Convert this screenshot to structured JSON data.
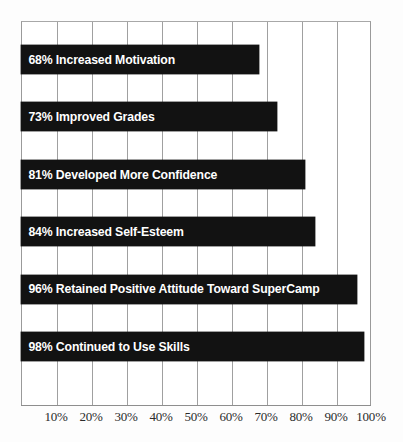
{
  "chart_data": {
    "type": "bar",
    "orientation": "horizontal",
    "title": "",
    "subtitle": "",
    "xlabel": "",
    "ylabel": "",
    "xlim": [
      0,
      100
    ],
    "grid": true,
    "legend": null,
    "categories": [
      "Increased Motivation",
      "Improved Grades",
      "Developed More Confidence",
      "Increased Self-Esteem",
      "Retained Positive Attitude Toward SuperCamp",
      "Continued to Use Skills"
    ],
    "values": [
      68,
      73,
      81,
      84,
      96,
      98
    ],
    "bar_labels": [
      "68% Increased Motivation",
      "73% Improved Grades",
      "81% Developed More Confidence",
      "84% Increased Self-Esteem",
      "96% Retained Positive Attitude Toward SuperCamp",
      "98% Continued to Use Skills"
    ],
    "xticks": [
      10,
      20,
      30,
      40,
      50,
      60,
      70,
      80,
      90,
      100
    ],
    "xtick_labels": [
      "10%",
      "20%",
      "30%",
      "40%",
      "50%",
      "60%",
      "70%",
      "80%",
      "90%",
      "100%"
    ],
    "colors": {
      "bar_fill": "#121212",
      "bar_label_text": "#ffffff",
      "gridline": "#a0a0a0",
      "frame": "#9a9a9a",
      "axis_text": "#2b2b2b",
      "background": "#ffffff"
    }
  }
}
